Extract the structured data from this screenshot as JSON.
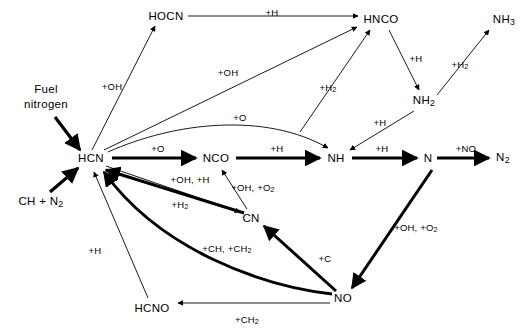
{
  "figure": {
    "kind": "reaction-pathway-diagram",
    "background_color": "#ffffff",
    "line_color": "#000000",
    "width": 527,
    "height": 334
  },
  "nodes": [
    {
      "id": "fuel_nitrogen",
      "label": "Fuel\nnitrogen",
      "x": 46,
      "y": 97,
      "multiline": true
    },
    {
      "id": "ch_n2",
      "label": "CH + N2",
      "x": 41,
      "y": 202,
      "multiline": false
    },
    {
      "id": "hcn",
      "label": "HCN",
      "x": 91,
      "y": 158,
      "multiline": false
    },
    {
      "id": "hocn",
      "label": "HOCN",
      "x": 166,
      "y": 16,
      "multiline": false
    },
    {
      "id": "hnco",
      "label": "HNCO",
      "x": 381,
      "y": 19,
      "multiline": false
    },
    {
      "id": "nh3",
      "label": "NH3",
      "x": 504,
      "y": 20,
      "multiline": false
    },
    {
      "id": "nh2",
      "label": "NH2",
      "x": 424,
      "y": 101,
      "multiline": false
    },
    {
      "id": "nco",
      "label": "NCO",
      "x": 216,
      "y": 158,
      "multiline": false
    },
    {
      "id": "nh",
      "label": "NH",
      "x": 336,
      "y": 158,
      "multiline": false
    },
    {
      "id": "n",
      "label": "N",
      "x": 428,
      "y": 158,
      "multiline": false
    },
    {
      "id": "n2",
      "label": "N2",
      "x": 503,
      "y": 158,
      "multiline": false
    },
    {
      "id": "cn",
      "label": "CN",
      "x": 251,
      "y": 218,
      "multiline": false
    },
    {
      "id": "no",
      "label": "NO",
      "x": 343,
      "y": 298,
      "multiline": false
    },
    {
      "id": "hcno",
      "label": "HCNO",
      "x": 152,
      "y": 308,
      "multiline": false
    }
  ],
  "edges": [
    {
      "id": "fuelN-hcn",
      "from": "fuel_nitrogen",
      "to": "hcn",
      "label": "",
      "weight": "thick"
    },
    {
      "id": "chn2-hcn",
      "from": "ch_n2",
      "to": "hcn",
      "label": "",
      "weight": "thick"
    },
    {
      "id": "hcn-hocn",
      "from": "hcn",
      "to": "hocn",
      "label": "+OH",
      "weight": "thin",
      "label_x": 112,
      "label_y": 86
    },
    {
      "id": "hocn-hnco",
      "from": "hocn",
      "to": "hnco",
      "label": "+H",
      "weight": "thin",
      "label_x": 272,
      "label_y": 12
    },
    {
      "id": "hcn-hnco",
      "from": "hcn",
      "to": "hnco",
      "label": "+OH",
      "weight": "thin",
      "label_x": 228,
      "label_y": 72
    },
    {
      "id": "nco-hnco",
      "from": "nco",
      "to": "hnco",
      "label": "+H2",
      "weight": "thin",
      "label_x": 328,
      "label_y": 88
    },
    {
      "id": "hnco-nh2",
      "from": "hnco",
      "to": "nh2",
      "label": "+H",
      "weight": "thin",
      "label_x": 416,
      "label_y": 58
    },
    {
      "id": "nh2-nh3",
      "from": "nh2",
      "to": "nh3",
      "label": "+H2",
      "weight": "thin",
      "label_x": 460,
      "label_y": 65
    },
    {
      "id": "nh2-nh",
      "from": "nh2",
      "to": "nh",
      "label": "+H",
      "weight": "thin",
      "label_x": 380,
      "label_y": 122
    },
    {
      "id": "hcn-nco",
      "from": "hcn",
      "to": "nco",
      "label": "+O",
      "weight": "thick",
      "label_x": 158,
      "label_y": 148
    },
    {
      "id": "hcn-nh",
      "from": "hcn",
      "to": "nh",
      "label": "+O",
      "weight": "thin",
      "label_x": 240,
      "label_y": 117
    },
    {
      "id": "nco-nh",
      "from": "nco",
      "to": "nh",
      "label": "+H",
      "weight": "thick",
      "label_x": 277,
      "label_y": 148
    },
    {
      "id": "nh-n",
      "from": "nh",
      "to": "n",
      "label": "+H",
      "weight": "thick",
      "label_x": 382,
      "label_y": 148
    },
    {
      "id": "n-n2",
      "from": "n",
      "to": "n2",
      "label": "+NO",
      "weight": "thick",
      "label_x": 466,
      "label_y": 148
    },
    {
      "id": "hcn-cn",
      "from": "hcn",
      "to": "cn",
      "label": "+OH, +H",
      "weight": "thin",
      "label_x": 190,
      "label_y": 179
    },
    {
      "id": "cn-hcn",
      "from": "cn",
      "to": "hcn",
      "label": "+H2",
      "weight": "thick",
      "label_x": 180,
      "label_y": 205
    },
    {
      "id": "cn-nco",
      "from": "cn",
      "to": "nco",
      "label": "+OH, +O2",
      "weight": "thin",
      "label_x": 253,
      "label_y": 188
    },
    {
      "id": "n-no",
      "from": "n",
      "to": "no",
      "label": "+OH, +O2",
      "weight": "thick",
      "label_x": 416,
      "label_y": 228
    },
    {
      "id": "no-cn",
      "from": "no",
      "to": "cn",
      "label": "+C",
      "weight": "thick",
      "label_x": 325,
      "label_y": 258
    },
    {
      "id": "no-hcn",
      "from": "no",
      "to": "hcn",
      "label": "+CH, +CH2",
      "weight": "thick",
      "label_x": 227,
      "label_y": 249
    },
    {
      "id": "no-hcno",
      "from": "no",
      "to": "hcno",
      "label": "+CH2",
      "weight": "thin",
      "label_x": 247,
      "label_y": 320
    },
    {
      "id": "hcno-hcn",
      "from": "hcno",
      "to": "hcn",
      "label": "+H",
      "weight": "thin",
      "label_x": 95,
      "label_y": 250
    }
  ]
}
